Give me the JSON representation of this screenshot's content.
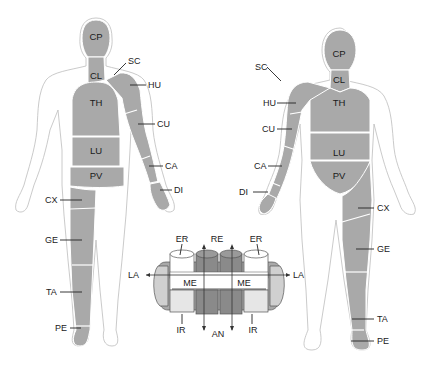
{
  "back_figure": {
    "segments": [
      {
        "id": "CP",
        "x": 96,
        "y": 37
      },
      {
        "id": "CL",
        "x": 96,
        "y": 76
      },
      {
        "id": "TH",
        "x": 96,
        "y": 104
      },
      {
        "id": "LU",
        "x": 96,
        "y": 152
      },
      {
        "id": "PV",
        "x": 96,
        "y": 177
      }
    ],
    "callouts": [
      {
        "id": "SC",
        "x": 128,
        "y": 61
      },
      {
        "id": "HU",
        "x": 150,
        "y": 88
      },
      {
        "id": "CU",
        "x": 159,
        "y": 127
      },
      {
        "id": "CA",
        "x": 167,
        "y": 168
      },
      {
        "id": "DI",
        "x": 175,
        "y": 192
      },
      {
        "id": "CX",
        "x": 45,
        "y": 203
      },
      {
        "id": "GE",
        "x": 45,
        "y": 243
      },
      {
        "id": "TA",
        "x": 47,
        "y": 295
      },
      {
        "id": "PE",
        "x": 56,
        "y": 328
      }
    ]
  },
  "front_figure": {
    "segments": [
      {
        "id": "CP",
        "x": 340,
        "y": 56
      },
      {
        "id": "CL",
        "x": 340,
        "y": 82
      },
      {
        "id": "TH",
        "x": 340,
        "y": 105
      },
      {
        "id": "LU",
        "x": 340,
        "y": 155
      },
      {
        "id": "PV",
        "x": 340,
        "y": 178
      }
    ],
    "callouts": [
      {
        "id": "SC",
        "x": 257,
        "y": 68
      },
      {
        "id": "HU",
        "x": 263,
        "y": 106
      },
      {
        "id": "CU",
        "x": 262,
        "y": 130
      },
      {
        "id": "CA",
        "x": 255,
        "y": 167
      },
      {
        "id": "DI",
        "x": 241,
        "y": 193
      },
      {
        "id": "CX",
        "x": 376,
        "y": 209
      },
      {
        "id": "GE",
        "x": 376,
        "y": 250
      },
      {
        "id": "TA",
        "x": 376,
        "y": 320
      },
      {
        "id": "PE",
        "x": 376,
        "y": 342
      }
    ]
  },
  "ring_diagram": {
    "labels": [
      {
        "id": "ER",
        "x": 182,
        "y": 241
      },
      {
        "id": "RE",
        "x": 217,
        "y": 241
      },
      {
        "id": "ER2",
        "text": "ER",
        "x": 252,
        "y": 241
      },
      {
        "id": "LA",
        "x": 136,
        "y": 275
      },
      {
        "id": "LA2",
        "text": "LA",
        "x": 296,
        "y": 275
      },
      {
        "id": "ME",
        "x": 196,
        "y": 285
      },
      {
        "id": "ME2",
        "text": "ME",
        "x": 241,
        "y": 285
      },
      {
        "id": "IR",
        "x": 182,
        "y": 333
      },
      {
        "id": "AN",
        "x": 217,
        "y": 336
      },
      {
        "id": "IR2",
        "text": "IR",
        "x": 252,
        "y": 333
      }
    ]
  },
  "colors": {
    "segment_fill": "#a9a9a9",
    "outline": "#bdbdbd",
    "text": "#222222"
  }
}
